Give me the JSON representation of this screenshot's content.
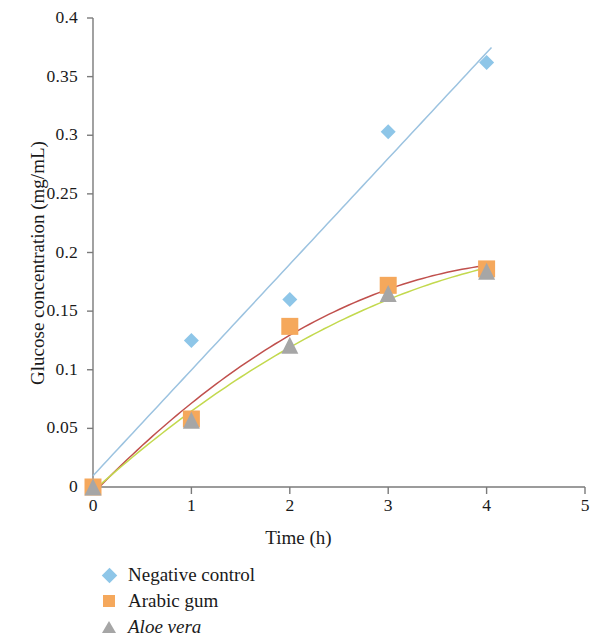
{
  "chart_data": {
    "type": "scatter",
    "title": "",
    "xlabel": "Time (h)",
    "ylabel": "Glucose concentration (mg/mL)",
    "xlim": [
      0,
      5
    ],
    "ylim": [
      0,
      0.4
    ],
    "xticks": [
      "0",
      "1",
      "2",
      "3",
      "4",
      "5"
    ],
    "xtick_values": [
      0,
      1,
      2,
      3,
      4,
      5
    ],
    "yticks": [
      "0",
      "0.05",
      "0.1",
      "0.15",
      "0.2",
      "0.25",
      "0.3",
      "0.35",
      "0.4"
    ],
    "ytick_values": [
      0,
      0.05,
      0.1,
      0.15,
      0.2,
      0.25,
      0.3,
      0.35,
      0.4
    ],
    "grid": false,
    "legend_position": "below",
    "x": [
      0,
      1,
      2,
      3,
      4
    ],
    "series": [
      {
        "name": "Negative control",
        "marker": "diamond",
        "color": "#8EC6E8",
        "trend": "linear",
        "trend_color": "#9CC3E0",
        "values": [
          0,
          0.125,
          0.16,
          0.303,
          0.362
        ]
      },
      {
        "name": "Arabic gum",
        "marker": "square",
        "color": "#F5A85C",
        "trend": "polynomial",
        "trend_color": "#C0504D",
        "values": [
          0,
          0.058,
          0.137,
          0.172,
          0.186
        ]
      },
      {
        "name": "Aloe vera",
        "marker": "triangle",
        "color": "#A6A6A6",
        "trend": "polynomial",
        "trend_color": "#C3D94E",
        "values": [
          0,
          0.057,
          0.121,
          0.165,
          0.184
        ]
      }
    ]
  },
  "axis": {
    "x_title": "Time (h)",
    "y_title": "Glucose concentration (mg/mL)",
    "line_color": "#7a7a7a"
  },
  "legend": {
    "items": [
      {
        "label": "Negative control",
        "marker": "diamond-marker-icon",
        "color": "#8EC6E8",
        "italic": false
      },
      {
        "label": "Arabic gum",
        "marker": "square-marker-icon",
        "color": "#F5A85C",
        "italic": false
      },
      {
        "label": "Aloe vera",
        "marker": "triangle-marker-icon",
        "color": "#A6A6A6",
        "italic": true
      }
    ]
  }
}
